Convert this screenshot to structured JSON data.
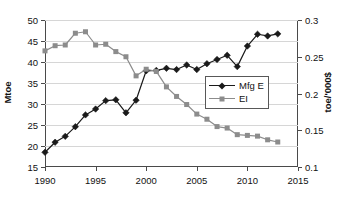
{
  "chart_data": {
    "type": "line",
    "title": "",
    "xlabel": "",
    "ylabel": "Mtoe",
    "ylabel_right": "toe/'000$",
    "grid": true,
    "legend_position": "center-right",
    "x": [
      1990,
      1991,
      1992,
      1993,
      1994,
      1995,
      1996,
      1997,
      1998,
      1999,
      2000,
      2001,
      2002,
      2003,
      2004,
      2005,
      2006,
      2007,
      2008,
      2009,
      2010,
      2011,
      2012,
      2013
    ],
    "xlim": [
      1990,
      2015
    ],
    "xticks": [
      1990,
      1995,
      2000,
      2005,
      2010,
      2015
    ],
    "xtick_labels": [
      "1990",
      "1995",
      "2000",
      "2005",
      "2010",
      "2015"
    ],
    "ylim": [
      15,
      50
    ],
    "yticks": [
      15,
      20,
      25,
      30,
      35,
      40,
      45,
      50
    ],
    "ytick_labels": [
      "15",
      "20",
      "25",
      "30",
      "35",
      "40",
      "45",
      "50"
    ],
    "ylim_right": [
      0.1,
      0.3
    ],
    "yticks_right": [
      0.1,
      0.15,
      0.2,
      0.25,
      0.3
    ],
    "ytick_labels_right": [
      "0.1",
      "0.15",
      "0.2",
      "0.25",
      "0.3"
    ],
    "series": [
      {
        "name": "Mfg E",
        "axis": "left",
        "color": "#1a1a1a",
        "marker": "diamond",
        "values": [
          18.5,
          20.9,
          22.3,
          24.6,
          27.4,
          28.8,
          30.8,
          31.0,
          27.9,
          30.9,
          37.9,
          38.0,
          38.5,
          38.2,
          39.3,
          38.2,
          39.6,
          40.6,
          41.6,
          38.9,
          43.8,
          46.6,
          46.2,
          46.7
        ]
      },
      {
        "name": "EI",
        "axis": "right",
        "color": "#8c8c8c",
        "marker": "square",
        "values": [
          0.258,
          0.265,
          0.266,
          0.282,
          0.284,
          0.266,
          0.267,
          0.257,
          0.25,
          0.224,
          0.233,
          0.23,
          0.209,
          0.196,
          0.185,
          0.172,
          0.165,
          0.155,
          0.153,
          0.144,
          0.143,
          0.142,
          0.137,
          0.134
        ]
      }
    ]
  },
  "legend": {
    "entries": [
      {
        "label": "Mfg E"
      },
      {
        "label": "EI"
      }
    ]
  }
}
